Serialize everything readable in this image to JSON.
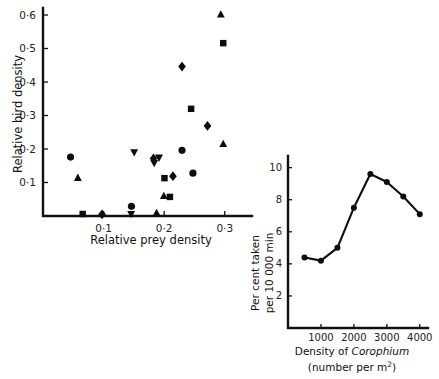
{
  "figure": {
    "background": "#ffffff",
    "ink_color": "#0d0d0d"
  },
  "chart_data": [
    {
      "id": "main-scatter",
      "type": "scatter",
      "title": "",
      "xlabel": "Relative prey density",
      "ylabel": "Relative bird density",
      "xlim": [
        0.0,
        0.345
      ],
      "ylim": [
        0.0,
        0.615
      ],
      "xticks": [
        0.1,
        0.2,
        0.3
      ],
      "xticklabels": [
        "0·1",
        "0·2",
        "0·3"
      ],
      "yticks": [
        0.1,
        0.2,
        0.3,
        0.4,
        0.5,
        0.6
      ],
      "yticklabels": [
        "0·1",
        "0·2",
        "0·3",
        "0·4",
        "0·5",
        "0·6"
      ],
      "grid": false,
      "legend": "none",
      "series": [
        {
          "name": "circle-series",
          "marker": "circle",
          "points": [
            {
              "x": 0.0455,
              "y": 0.176
            },
            {
              "x": 0.146,
              "y": 0.029
            },
            {
              "x": 0.2295,
              "y": 0.196
            },
            {
              "x": 0.2475,
              "y": 0.128
            }
          ]
        },
        {
          "name": "square-series",
          "marker": "square",
          "points": [
            {
              "x": 0.0655,
              "y": 0.006
            },
            {
              "x": 0.2005,
              "y": 0.113
            },
            {
              "x": 0.2095,
              "y": 0.057
            },
            {
              "x": 0.2445,
              "y": 0.32
            },
            {
              "x": 0.2975,
              "y": 0.516
            }
          ]
        },
        {
          "name": "triangle-up-series",
          "marker": "triangle-up",
          "points": [
            {
              "x": 0.0575,
              "y": 0.114
            },
            {
              "x": 0.1875,
              "y": 0.009
            },
            {
              "x": 0.1995,
              "y": 0.06
            },
            {
              "x": 0.2975,
              "y": 0.215
            },
            {
              "x": 0.2935,
              "y": 0.602
            }
          ]
        },
        {
          "name": "triangle-down-series",
          "marker": "triangle-down",
          "points": [
            {
              "x": 0.1455,
              "y": 0.006
            },
            {
              "x": 0.1505,
              "y": 0.19
            },
            {
              "x": 0.1835,
              "y": 0.158
            },
            {
              "x": 0.1915,
              "y": 0.174
            }
          ]
        },
        {
          "name": "diamond-series",
          "marker": "diamond",
          "points": [
            {
              "x": 0.0975,
              "y": 0.005
            },
            {
              "x": 0.1825,
              "y": 0.172
            },
            {
              "x": 0.2145,
              "y": 0.119
            },
            {
              "x": 0.2295,
              "y": 0.446
            },
            {
              "x": 0.2715,
              "y": 0.269
            }
          ]
        }
      ]
    },
    {
      "id": "inset-line",
      "type": "line",
      "title": "",
      "xlabel_line1": "Density of ",
      "xlabel_italic": "Corophium",
      "xlabel_line2": "(number per m",
      "xlabel_exponent": "2",
      "xlabel_line2_end": ")",
      "ylabel_line1": "Per cent taken",
      "ylabel_line2": "per 10 000 min",
      "xlim": [
        0,
        4250
      ],
      "ylim": [
        0,
        10.6
      ],
      "xticks": [
        1000,
        2000,
        3000,
        4000
      ],
      "xticklabels": [
        "1000",
        "2000",
        "3000",
        "4000"
      ],
      "yticks": [
        2,
        4,
        6,
        8,
        10
      ],
      "yticklabels": [
        "2",
        "4",
        "6",
        "8",
        "10"
      ],
      "grid": false,
      "legend": "none",
      "x": [
        500,
        1000,
        1500,
        2000,
        2500,
        3000,
        3500,
        4000
      ],
      "values": [
        4.4,
        4.2,
        5.0,
        7.5,
        9.6,
        9.1,
        8.2,
        7.1
      ],
      "marker": "circle"
    }
  ]
}
